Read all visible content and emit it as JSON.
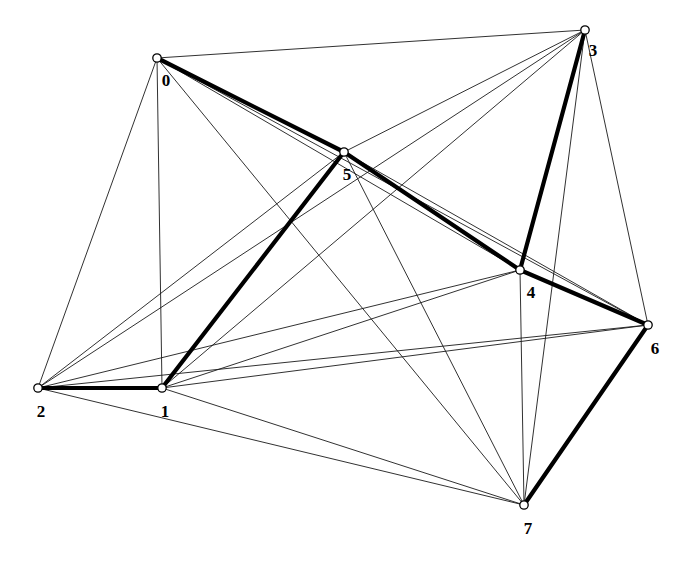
{
  "figure": {
    "type": "node-link-diagram",
    "background_color": "#ffffff",
    "edge_color": "#1a1a1a",
    "bold_edge_color": "#000000",
    "node_fill": "#ffffff",
    "node_stroke": "#000000",
    "label_color": "#000000"
  },
  "graph_data": {
    "type": "graph",
    "directed": false,
    "node_count": 8,
    "edge_count": 28,
    "nodes": [
      {
        "id": "0",
        "label": "0",
        "x": 157,
        "y": 58,
        "label_x": 166,
        "label_y": 82
      },
      {
        "id": "1",
        "label": "1",
        "x": 162,
        "y": 388,
        "label_x": 165,
        "label_y": 413
      },
      {
        "id": "2",
        "label": "2",
        "x": 38,
        "y": 388,
        "label_x": 41,
        "label_y": 413
      },
      {
        "id": "3",
        "label": "3",
        "x": 585,
        "y": 30,
        "label_x": 593,
        "label_y": 52
      },
      {
        "id": "4",
        "label": "4",
        "x": 520,
        "y": 270,
        "label_x": 531,
        "label_y": 294
      },
      {
        "id": "5",
        "label": "5",
        "x": 344,
        "y": 152,
        "label_x": 347,
        "label_y": 176
      },
      {
        "id": "6",
        "label": "6",
        "x": 648,
        "y": 325,
        "label_x": 655,
        "label_y": 350
      },
      {
        "id": "7",
        "label": "7",
        "x": 524,
        "y": 505,
        "label_x": 528,
        "label_y": 530
      }
    ],
    "edges": [
      {
        "source": "0",
        "target": "3",
        "bold": false
      },
      {
        "source": "0",
        "target": "1",
        "bold": false
      },
      {
        "source": "0",
        "target": "2",
        "bold": false
      },
      {
        "source": "0",
        "target": "4",
        "bold": false
      },
      {
        "source": "0",
        "target": "6",
        "bold": false
      },
      {
        "source": "0",
        "target": "7",
        "bold": false
      },
      {
        "source": "0",
        "target": "5",
        "bold": true
      },
      {
        "source": "1",
        "target": "2",
        "bold": true
      },
      {
        "source": "1",
        "target": "5",
        "bold": true
      },
      {
        "source": "1",
        "target": "3",
        "bold": false
      },
      {
        "source": "1",
        "target": "4",
        "bold": false
      },
      {
        "source": "1",
        "target": "6",
        "bold": false
      },
      {
        "source": "1",
        "target": "7",
        "bold": false
      },
      {
        "source": "2",
        "target": "3",
        "bold": false
      },
      {
        "source": "2",
        "target": "4",
        "bold": false
      },
      {
        "source": "2",
        "target": "5",
        "bold": false
      },
      {
        "source": "2",
        "target": "6",
        "bold": false
      },
      {
        "source": "2",
        "target": "7",
        "bold": false
      },
      {
        "source": "3",
        "target": "5",
        "bold": false
      },
      {
        "source": "3",
        "target": "6",
        "bold": false
      },
      {
        "source": "3",
        "target": "7",
        "bold": false
      },
      {
        "source": "3",
        "target": "4",
        "bold": true
      },
      {
        "source": "4",
        "target": "5",
        "bold": true
      },
      {
        "source": "4",
        "target": "7",
        "bold": false
      },
      {
        "source": "4",
        "target": "6",
        "bold": true
      },
      {
        "source": "5",
        "target": "6",
        "bold": false
      },
      {
        "source": "5",
        "target": "7",
        "bold": false
      },
      {
        "source": "6",
        "target": "7",
        "bold": true
      }
    ],
    "highlighted_path": [
      "2",
      "1",
      "5",
      "0",
      "5",
      "4",
      "3",
      "4",
      "6",
      "7"
    ]
  }
}
